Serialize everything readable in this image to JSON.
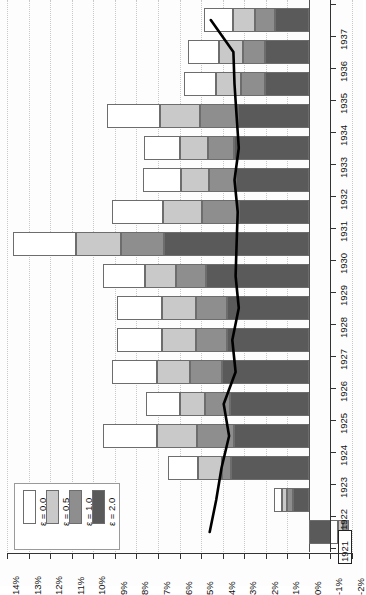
{
  "chart_data": {
    "type": "bar",
    "orientation": "rotated-90",
    "stacked": true,
    "title": "",
    "xlabel": "",
    "ylabel": "",
    "grid": true,
    "legend_position": "bottom-left",
    "value_axis": {
      "ticks": [
        "14%",
        "13%",
        "12%",
        "11%",
        "10%",
        "9%",
        "8%",
        "7%",
        "6%",
        "5%",
        "4%",
        "3%",
        "2%",
        "1%",
        "0%",
        "-1%",
        "-2%"
      ],
      "values": [
        14,
        13,
        12,
        11,
        10,
        9,
        8,
        7,
        6,
        5,
        4,
        3,
        2,
        1,
        0,
        -1,
        -2
      ],
      "min": -2,
      "max": 14
    },
    "categories": [
      "1937",
      "1936",
      "1935",
      "1934",
      "1933",
      "1932",
      "1931",
      "1930",
      "1929",
      "1928",
      "1927",
      "1926",
      "1925",
      "1924",
      "1923",
      "1922",
      "1921"
    ],
    "highlighted_category": "1921",
    "series": [
      {
        "name": "ε = 0.0",
        "color": "#ffffff",
        "values": [
          1.35,
          1.45,
          1.5,
          2.45,
          1.65,
          1.75,
          2.4,
          2.9,
          1.95,
          2.1,
          2.1,
          2.1,
          1.55,
          2.5,
          1.4,
          0.35,
          0.35
        ]
      },
      {
        "name": "ε = 0.5",
        "color": "#c9c9c9",
        "values": [
          1.0,
          1.1,
          1.15,
          1.85,
          1.3,
          1.3,
          1.8,
          2.1,
          1.45,
          1.55,
          1.55,
          1.55,
          1.2,
          1.85,
          1.1,
          0.25,
          0.25
        ]
      },
      {
        "name": "ε = 1.0",
        "color": "#8e8e8e",
        "values": [
          0.95,
          1.0,
          1.1,
          1.75,
          1.25,
          1.25,
          1.7,
          2.0,
          1.4,
          1.45,
          1.45,
          1.45,
          1.15,
          1.75,
          0.45,
          0.25,
          0.25
        ]
      },
      {
        "name": "ε = 2.0",
        "color": "#5a5a5a",
        "values": [
          1.55,
          2.05,
          2.05,
          3.3,
          3.45,
          3.4,
          3.25,
          6.7,
          4.75,
          3.8,
          3.8,
          4.05,
          3.65,
          3.45,
          3.6,
          0.75,
          -1.85
        ]
      }
    ],
    "line_series": {
      "name": "reference-line",
      "color": "#000000",
      "values": [
        4.55,
        3.5,
        3.45,
        3.35,
        3.25,
        3.45,
        3.3,
        3.35,
        3.4,
        3.25,
        3.55,
        3.4,
        3.95,
        3.7,
        4.05,
        4.3,
        4.6
      ]
    }
  },
  "legend": {
    "items": [
      {
        "label": "ε = 0.0",
        "color": "#ffffff"
      },
      {
        "label": "ε = 0.5",
        "color": "#c9c9c9"
      },
      {
        "label": "ε = 1.0",
        "color": "#8e8e8e"
      },
      {
        "label": "ε = 2.0",
        "color": "#5a5a5a"
      }
    ]
  }
}
